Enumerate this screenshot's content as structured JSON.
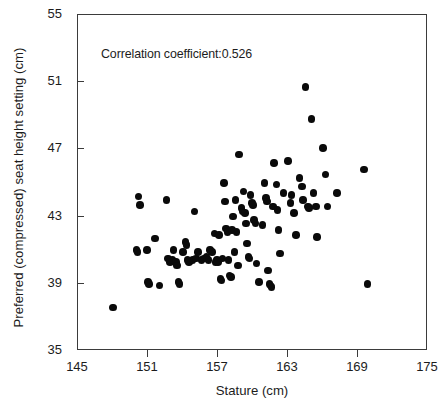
{
  "chart_data": {
    "type": "scatter",
    "title": "",
    "xlabel": "Stature (cm)",
    "ylabel": "Preferred (compressed) seat height setting (cm)",
    "xlim": [
      145,
      175
    ],
    "ylim": [
      35,
      55
    ],
    "xticks": [
      145,
      151,
      157,
      163,
      169,
      175
    ],
    "yticks": [
      35,
      39,
      43,
      47,
      51,
      55
    ],
    "grid": false,
    "legend": null,
    "annotations": [
      {
        "text": "Correlation coefficient:0.526",
        "x": 147.1,
        "y": 52.1
      }
    ],
    "marker": {
      "shape": "circle",
      "color": "#0a0a0a",
      "size_px": 7.6
    },
    "correlation_coefficient": 0.526,
    "n_points": 118,
    "points": [
      [
        148.0,
        37.6
      ],
      [
        150.0,
        41.0
      ],
      [
        150.1,
        40.9
      ],
      [
        150.2,
        44.2
      ],
      [
        150.3,
        43.7
      ],
      [
        150.9,
        41.0
      ],
      [
        151.0,
        39.1
      ],
      [
        151.1,
        39.0
      ],
      [
        151.6,
        41.7
      ],
      [
        152.0,
        38.9
      ],
      [
        152.6,
        44.0
      ],
      [
        152.7,
        40.5
      ],
      [
        152.9,
        40.3
      ],
      [
        153.1,
        40.4
      ],
      [
        153.2,
        41.0
      ],
      [
        153.4,
        40.3
      ],
      [
        153.5,
        40.1
      ],
      [
        153.6,
        39.1
      ],
      [
        153.7,
        39.0
      ],
      [
        154.0,
        40.9
      ],
      [
        154.2,
        41.5
      ],
      [
        154.3,
        41.3
      ],
      [
        154.4,
        40.4
      ],
      [
        154.5,
        40.3
      ],
      [
        154.8,
        40.4
      ],
      [
        155.0,
        43.3
      ],
      [
        155.1,
        40.5
      ],
      [
        155.3,
        40.9
      ],
      [
        155.6,
        40.4
      ],
      [
        155.8,
        40.5
      ],
      [
        156.0,
        40.6
      ],
      [
        156.2,
        40.4
      ],
      [
        156.3,
        41.0
      ],
      [
        156.5,
        40.9
      ],
      [
        156.7,
        42.0
      ],
      [
        156.8,
        40.3
      ],
      [
        156.9,
        40.4
      ],
      [
        157.0,
        40.3
      ],
      [
        157.1,
        41.9
      ],
      [
        157.2,
        39.3
      ],
      [
        157.3,
        39.2
      ],
      [
        157.4,
        40.5
      ],
      [
        157.5,
        45.0
      ],
      [
        157.6,
        43.9
      ],
      [
        157.7,
        42.3
      ],
      [
        157.8,
        42.1
      ],
      [
        157.9,
        40.4
      ],
      [
        158.0,
        39.5
      ],
      [
        158.1,
        39.4
      ],
      [
        158.2,
        42.2
      ],
      [
        158.3,
        43.0
      ],
      [
        158.4,
        40.9
      ],
      [
        158.5,
        44.0
      ],
      [
        158.6,
        42.1
      ],
      [
        158.7,
        40.1
      ],
      [
        158.8,
        46.7
      ],
      [
        159.0,
        43.5
      ],
      [
        159.1,
        43.3
      ],
      [
        159.2,
        44.5
      ],
      [
        159.3,
        43.2
      ],
      [
        159.4,
        42.6
      ],
      [
        159.5,
        41.4
      ],
      [
        159.6,
        40.6
      ],
      [
        159.7,
        40.5
      ],
      [
        159.8,
        44.3
      ],
      [
        159.9,
        43.8
      ],
      [
        160.0,
        43.7
      ],
      [
        160.1,
        42.8
      ],
      [
        160.2,
        42.6
      ],
      [
        160.3,
        40.2
      ],
      [
        160.5,
        39.1
      ],
      [
        160.8,
        42.5
      ],
      [
        161.0,
        45.0
      ],
      [
        161.1,
        44.1
      ],
      [
        161.2,
        43.9
      ],
      [
        161.3,
        39.8
      ],
      [
        161.4,
        39.0
      ],
      [
        161.5,
        38.9
      ],
      [
        161.6,
        38.8
      ],
      [
        161.7,
        43.6
      ],
      [
        161.8,
        46.2
      ],
      [
        162.0,
        44.9
      ],
      [
        162.1,
        43.4
      ],
      [
        162.2,
        42.2
      ],
      [
        162.3,
        40.8
      ],
      [
        162.6,
        44.4
      ],
      [
        163.0,
        46.3
      ],
      [
        163.2,
        43.8
      ],
      [
        163.3,
        44.3
      ],
      [
        163.5,
        43.2
      ],
      [
        163.7,
        41.9
      ],
      [
        164.0,
        45.3
      ],
      [
        164.2,
        44.8
      ],
      [
        164.3,
        44.0
      ],
      [
        164.5,
        50.7
      ],
      [
        164.7,
        43.6
      ],
      [
        164.8,
        43.5
      ],
      [
        165.0,
        48.8
      ],
      [
        165.2,
        44.4
      ],
      [
        165.4,
        43.6
      ],
      [
        165.5,
        41.8
      ],
      [
        166.0,
        47.1
      ],
      [
        166.2,
        45.5
      ],
      [
        166.4,
        43.6
      ],
      [
        167.2,
        44.4
      ],
      [
        169.5,
        45.8
      ],
      [
        169.8,
        39.0
      ]
    ]
  },
  "axes": {
    "x_tick_labels": [
      "145",
      "151",
      "157",
      "163",
      "169",
      "175"
    ],
    "y_tick_labels": [
      "35",
      "39",
      "43",
      "47",
      "51",
      "55"
    ],
    "x_title": "Stature (cm)",
    "y_title": "Preferred (compressed) seat height setting (cm)"
  },
  "annotation_text": "Correlation coefficient:0.526",
  "colors": {
    "marker": "#0a0a0a",
    "axis": "#3b3b3b",
    "text": "#1c1c1c",
    "background": "#ffffff"
  }
}
